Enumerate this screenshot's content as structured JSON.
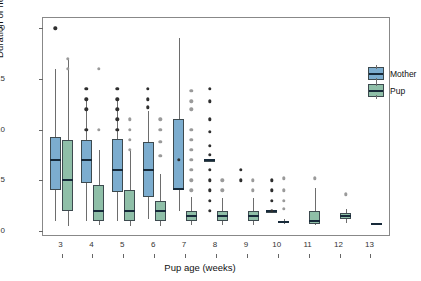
{
  "chart_data": {
    "type": "box",
    "title": "",
    "xlabel": "Pup age (weeks)",
    "ylabel": "Duration of nursing bouts (min)",
    "xlim": [
      2.4,
      13.6
    ],
    "ylim": [
      -0.4,
      21.0
    ],
    "yticks": [
      0,
      5,
      10,
      15,
      20
    ],
    "xticks": [
      3,
      4,
      5,
      6,
      7,
      8,
      9,
      10,
      11,
      12,
      13
    ],
    "grid": false,
    "legend_position": "top-right",
    "legend": [
      "Mother",
      "Pup"
    ],
    "colors": {
      "mother": "#7CADCF",
      "pup": "#8FBFA8",
      "median": "#172a3a",
      "outline": "#3d4a4f",
      "whisker": "#6d6d6d",
      "outlier_mother": "#2f2f2f",
      "outlier_pup": "#9a9a9a"
    },
    "categories": [
      3,
      4,
      5,
      6,
      7,
      8,
      9,
      10,
      11,
      12,
      13
    ],
    "series": [
      {
        "name": "Mother",
        "boxes": [
          {
            "x": 3,
            "min": 1.0,
            "q1": 4.0,
            "median": 7.0,
            "q3": 9.3,
            "max": 16.0,
            "outliers": [
              20.0
            ]
          },
          {
            "x": 4,
            "min": 1.0,
            "q1": 4.7,
            "median": 7.0,
            "q3": 9.0,
            "max": 12.8,
            "outliers": [
              14.0,
              13.0,
              12.0,
              10.0
            ]
          },
          {
            "x": 5,
            "min": 1.0,
            "q1": 3.8,
            "median": 6.0,
            "q3": 9.1,
            "max": 12.8,
            "outliers": [
              14.0,
              13.0,
              12.0,
              11.0,
              10.0
            ]
          },
          {
            "x": 6,
            "min": 1.2,
            "q1": 3.3,
            "median": 6.0,
            "q3": 8.8,
            "max": 11.8,
            "outliers": [
              14.0,
              13.0,
              12.2
            ]
          },
          {
            "x": 7,
            "min": 2.0,
            "q1": 4.0,
            "median": 4.1,
            "q3": 11.0,
            "max": 19.0,
            "outliers": [
              7.0
            ]
          },
          {
            "x": 8,
            "min": 7.0,
            "q1": 7.0,
            "median": 7.0,
            "q3": 7.0,
            "max": 7.0,
            "outliers": [
              14.0,
              12.8,
              11.0,
              9.8,
              8.4,
              7.5,
              6.0,
              5.0,
              4.0,
              3.0,
              2.0
            ]
          },
          {
            "x": 9,
            "min": null,
            "q1": null,
            "median": null,
            "q3": null,
            "max": null,
            "outliers": [
              6.0,
              5.0
            ]
          },
          {
            "x": 10,
            "min": 2.0,
            "q1": 2.0,
            "median": 2.0,
            "q3": 2.0,
            "max": 2.0,
            "outliers": [
              5.0,
              4.0,
              3.0,
              2.0
            ]
          },
          {
            "x": 11,
            "min": null,
            "q1": null,
            "median": null,
            "q3": null,
            "max": null,
            "outliers": []
          },
          {
            "x": 12,
            "min": null,
            "q1": null,
            "median": null,
            "q3": null,
            "max": null,
            "outliers": []
          },
          {
            "x": 13,
            "min": null,
            "q1": null,
            "median": null,
            "q3": null,
            "max": null,
            "outliers": []
          }
        ]
      },
      {
        "name": "Pup",
        "boxes": [
          {
            "x": 3,
            "min": 0.5,
            "q1": 2.0,
            "median": 5.0,
            "q3": 9.0,
            "max": 17.0,
            "outliers": [
              17.0,
              16.0
            ]
          },
          {
            "x": 4,
            "min": 0.6,
            "q1": 1.0,
            "median": 2.0,
            "q3": 4.5,
            "max": 8.0,
            "outliers": [
              16.0,
              10.0
            ]
          },
          {
            "x": 5,
            "min": 0.5,
            "q1": 1.0,
            "median": 2.0,
            "q3": 4.0,
            "max": 8.0,
            "outliers": [
              11.0,
              10.0,
              9.0,
              8.0
            ]
          },
          {
            "x": 6,
            "min": 0.5,
            "q1": 1.0,
            "median": 2.0,
            "q3": 3.0,
            "max": 5.6,
            "outliers": [
              11.0,
              10.0,
              8.8,
              7.4
            ]
          },
          {
            "x": 7,
            "min": 0.6,
            "q1": 1.0,
            "median": 1.5,
            "q3": 2.0,
            "max": 3.3,
            "outliers": [
              13.8,
              12.8,
              12.0,
              10.0,
              9.0,
              8.0,
              7.0,
              6.0,
              5.0,
              4.0
            ]
          },
          {
            "x": 8,
            "min": 0.6,
            "q1": 1.0,
            "median": 1.5,
            "q3": 2.0,
            "max": 3.2,
            "outliers": [
              5.0,
              4.0
            ]
          },
          {
            "x": 9,
            "min": 0.6,
            "q1": 1.0,
            "median": 1.5,
            "q3": 2.0,
            "max": 3.2,
            "outliers": [
              5.0,
              4.0
            ]
          },
          {
            "x": 10,
            "min": 0.7,
            "q1": 0.8,
            "median": 0.9,
            "q3": 1.0,
            "max": 1.2,
            "outliers": [
              5.2,
              4.0,
              3.0,
              2.2
            ]
          },
          {
            "x": 11,
            "min": 0.6,
            "q1": 0.7,
            "median": 1.0,
            "q3": 2.0,
            "max": 4.2,
            "outliers": [
              5.2
            ]
          },
          {
            "x": 12,
            "min": 0.8,
            "q1": 1.2,
            "median": 1.5,
            "q3": 1.8,
            "max": 2.2,
            "outliers": [
              3.6
            ]
          },
          {
            "x": 13,
            "min": 0.6,
            "q1": 0.6,
            "median": 0.7,
            "q3": 0.8,
            "max": 0.8,
            "outliers": []
          }
        ]
      }
    ]
  }
}
